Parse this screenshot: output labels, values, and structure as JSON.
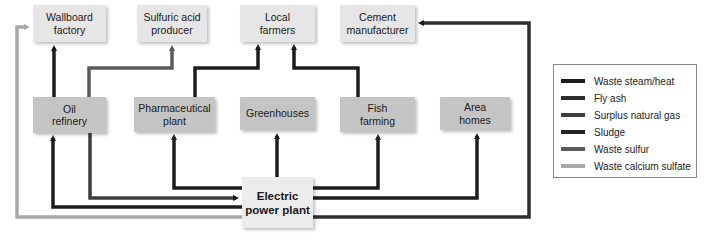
{
  "nodes": {
    "wallboard": "Wallboard factory",
    "sulfuric": "Sulfuric acid producer",
    "farmers": "Local farmers",
    "cement": "Cement manufacturer",
    "refinery": "Oil refinery",
    "pharma": "Pharmaceutical plant",
    "greenhouses": "Greenhouses",
    "fish": "Fish farming",
    "homes": "Area homes",
    "plant": "Electric power plant"
  },
  "legend": [
    {
      "label": "Waste steam/heat",
      "color": "#1c1c1c"
    },
    {
      "label": "Fly ash",
      "color": "#2e2e2e"
    },
    {
      "label": "Surplus natural gas",
      "color": "#3e3e3e"
    },
    {
      "label": "Sludge",
      "color": "#242424"
    },
    {
      "label": "Waste sulfur",
      "color": "#5a5a5a"
    },
    {
      "label": "Waste calcium sulfate",
      "color": "#a8a8a8"
    }
  ]
}
